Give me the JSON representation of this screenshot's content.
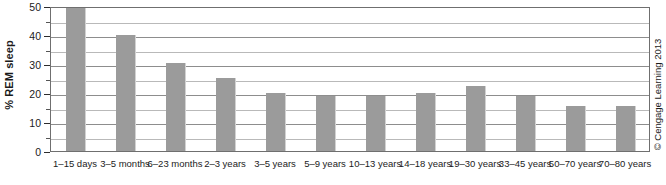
{
  "chart_data": {
    "type": "bar",
    "title": "",
    "xlabel": "",
    "ylabel": "% REM sleep",
    "ylim": [
      0,
      50
    ],
    "ytick_step": 10,
    "minor_tick_step": 5,
    "grid": true,
    "legend": "none",
    "bar_color": "#9b9b9b",
    "yticks": [
      0,
      10,
      20,
      30,
      40,
      50
    ],
    "ytick_labels": [
      "0",
      "10",
      "20",
      "30",
      "40",
      "50"
    ],
    "minor_ticks": [
      5,
      15,
      25,
      35,
      45
    ],
    "categories": [
      "1–15 days",
      "3–5 months",
      "6–23 months",
      "2–3 years",
      "3–5 years",
      "5–9 years",
      "10–13 years",
      "14–18 years",
      "19–30 years",
      "33–45 years",
      "50–70 years",
      "70–80 years"
    ],
    "values": [
      50,
      40,
      30.5,
      25,
      20,
      19,
      19,
      20,
      22.5,
      19,
      15.5,
      15.5
    ]
  },
  "credit": {
    "text": "© Cengage Learning 2013"
  }
}
